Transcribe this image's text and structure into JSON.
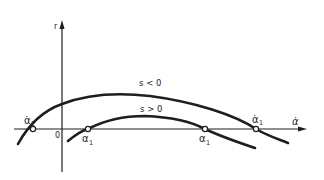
{
  "figure": {
    "axes": {
      "y_label": "r",
      "x_label": "α̇",
      "origin_label": "0"
    },
    "curves": [
      {
        "name": "outer",
        "label": "s < 0"
      },
      {
        "name": "inner",
        "label": "s > 0"
      }
    ],
    "points": [
      {
        "label": "α̇₂",
        "base": "α̇",
        "sub": "2"
      },
      {
        "label": "α₁",
        "base": "α",
        "sub": "1"
      },
      {
        "label": "α₁",
        "base": "α",
        "sub": "1"
      },
      {
        "label": "α̇₁",
        "base": "α̇",
        "sub": "1"
      }
    ],
    "colors": {
      "ink": "#1e1e1e",
      "background": "#ffffff"
    }
  }
}
